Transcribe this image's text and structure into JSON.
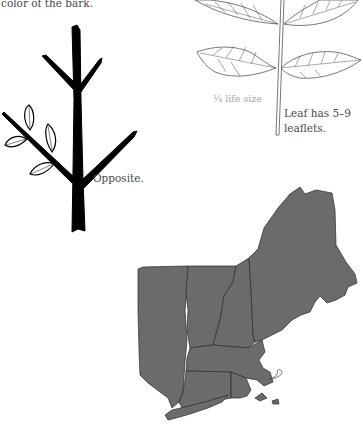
{
  "caption_top": "color of the bark.",
  "twig": {
    "label": "Opposite.",
    "icon": "opposite-branching-twig-illustration"
  },
  "leaf": {
    "scale_label": "¼ life size",
    "note_line1": "Leaf has 5–9",
    "note_line2": "leaflets.",
    "icon": "compound-leaf-illustration"
  },
  "range_map": {
    "region": "New England and New York",
    "fill_color": "#6b6b6b",
    "border_color": "#1a1a1a",
    "icon": "range-map"
  }
}
